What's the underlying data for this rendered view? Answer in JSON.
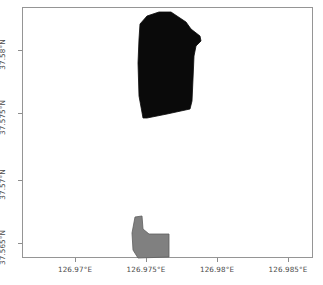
{
  "figure": {
    "title": "",
    "background_color": "#ffffff",
    "frame_color": "#959595"
  },
  "chart_data": {
    "type": "map",
    "title": "",
    "xlabel": "",
    "ylabel": "",
    "projection": "geographic-lonlat",
    "grid": false,
    "legend": null,
    "xlim": [
      126.9681,
      126.9872
    ],
    "ylim": [
      37.5632,
      37.5818
    ],
    "xticks": [
      126.97,
      126.975,
      126.98,
      126.985
    ],
    "yticks": [
      37.565,
      37.57,
      37.575,
      37.58
    ],
    "xtick_labels": [
      "126.97°E",
      "126.975°E",
      "126.98°E",
      "126.985°E"
    ],
    "ytick_labels": [
      "37.565°N",
      "37.57°N",
      "37.575°N",
      "37.58°N"
    ],
    "xtick_px": [
      75,
      146,
      217,
      288
    ],
    "ytick_px": [
      243,
      180,
      113,
      50
    ],
    "series": [
      {
        "name": "polygon-upper",
        "fill_color": "#0a0a0a",
        "edge_color": "#0a0a0a",
        "points_px": [
          [
            139,
            23
          ],
          [
            146,
            15
          ],
          [
            158,
            11
          ],
          [
            170,
            11
          ],
          [
            185,
            21
          ],
          [
            190,
            28
          ],
          [
            199,
            35
          ],
          [
            200,
            40
          ],
          [
            195,
            45
          ],
          [
            193,
            55
          ],
          [
            192,
            78
          ],
          [
            191,
            100
          ],
          [
            189,
            108
          ],
          [
            166,
            113
          ],
          [
            146,
            117
          ],
          [
            142,
            117
          ],
          [
            138,
            95
          ],
          [
            137,
            62
          ],
          [
            138,
            38
          ]
        ]
      },
      {
        "name": "polygon-lower",
        "fill_color": "#808080",
        "edge_color": "#5e5e5e",
        "points_px": [
          [
            134,
            216
          ],
          [
            141,
            215
          ],
          [
            142,
            228
          ],
          [
            148,
            233
          ],
          [
            168,
            233
          ],
          [
            168,
            256
          ],
          [
            137,
            257
          ],
          [
            132,
            249
          ],
          [
            131,
            232
          ]
        ]
      }
    ]
  },
  "axes": {
    "x_ticks": [
      {
        "label": "126.97°E",
        "px": 75
      },
      {
        "label": "126.975°E",
        "px": 146
      },
      {
        "label": "126.98°E",
        "px": 217
      },
      {
        "label": "126.985°E",
        "px": 288
      }
    ],
    "y_ticks": [
      {
        "label": "37.58°N",
        "px": 50
      },
      {
        "label": "37.575°N",
        "px": 113
      },
      {
        "label": "37.57°N",
        "px": 180
      },
      {
        "label": "37.565°N",
        "px": 243
      }
    ]
  }
}
